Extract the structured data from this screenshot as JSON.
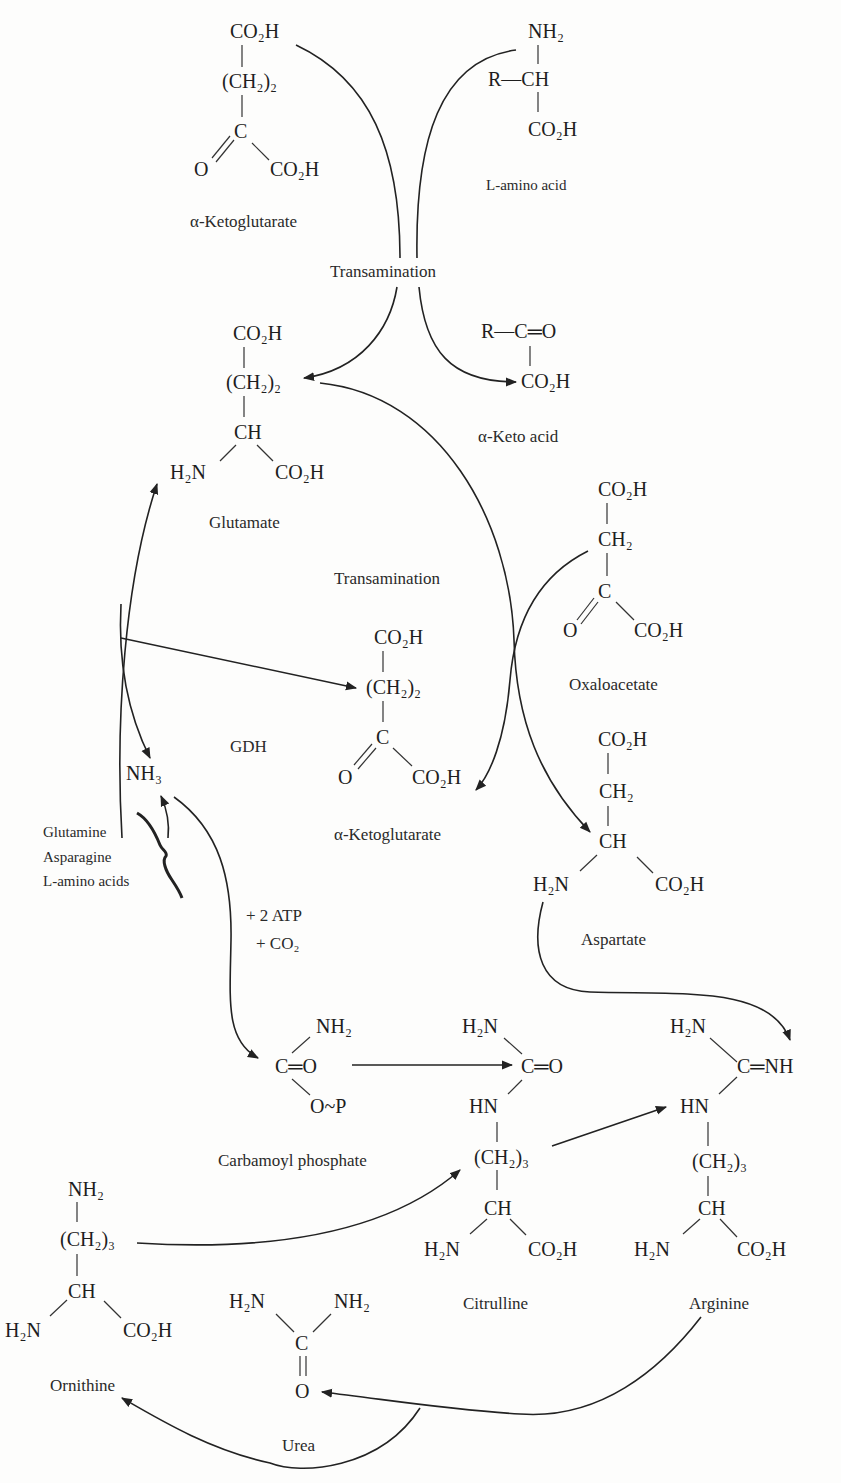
{
  "diagram": {
    "molecules": {
      "akg_top": {
        "name": "α-Ketoglutarate",
        "lines": [
          "CO₂H",
          "(CH₂)₂",
          "C",
          "O",
          "CO₂H"
        ]
      },
      "amino_acid": {
        "name": "L-amino acid",
        "lines": [
          "NH₂",
          "R—CH",
          "CO₂H"
        ]
      },
      "glutamate": {
        "name": "Glutamate",
        "lines": [
          "CO₂H",
          "(CH₂)₂",
          "CH",
          "H₂N",
          "CO₂H"
        ]
      },
      "keto_acid": {
        "name": "α-Keto acid",
        "lines": [
          "R—C═O",
          "CO₂H"
        ]
      },
      "oxaloacetate": {
        "name": "Oxaloacetate",
        "lines": [
          "CO₂H",
          "CH₂",
          "C",
          "O",
          "CO₂H"
        ]
      },
      "akg_mid": {
        "name": "α-Ketoglutarate",
        "lines": [
          "CO₂H",
          "(CH₂)₂",
          "C",
          "O",
          "CO₂H"
        ]
      },
      "aspartate": {
        "name": "Aspartate",
        "lines": [
          "CO₂H",
          "CH₂",
          "CH",
          "H₂N",
          "CO₂H"
        ]
      },
      "ammonia": {
        "name": "NH₃"
      },
      "carbamoyl_phosphate": {
        "name": "Carbamoyl phosphate",
        "lines": [
          "NH₂",
          "C═O",
          "O~P"
        ]
      },
      "citrulline": {
        "name": "Citrulline",
        "lines": [
          "H₂N",
          "C═O",
          "HN",
          "(CH₂)₃",
          "CH",
          "H₂N",
          "CO₂H"
        ]
      },
      "arginine": {
        "name": "Arginine",
        "lines": [
          "H₂N",
          "C═NH",
          "HN",
          "(CH₂)₃",
          "CH",
          "H₂N",
          "CO₂H"
        ]
      },
      "ornithine": {
        "name": "Ornithine",
        "lines": [
          "NH₂",
          "(CH₂)₃",
          "CH",
          "H₂N",
          "CO₂H"
        ]
      },
      "urea": {
        "name": "Urea",
        "lines": [
          "H₂N",
          "NH₂",
          "C",
          "O"
        ]
      }
    },
    "processes": {
      "transamination_top": "Transamination",
      "transamination_mid": "Transamination",
      "gdh": "GDH",
      "cofactors_line1": "+ 2 ATP",
      "cofactors_line2": "+ CO₂"
    },
    "nh3_sources": [
      "Glutamine",
      "Asparagine",
      "L-amino acids"
    ]
  }
}
